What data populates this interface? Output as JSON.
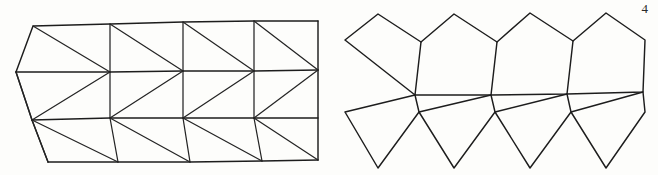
{
  "page": {
    "page_number": "4",
    "background_color": "#fdfdfb",
    "ink_color": "#1d1d1d",
    "width": 658,
    "height": 175
  },
  "figures": [
    {
      "id": "left-net",
      "name": "triangulated-strip-net",
      "kind": "triangle-strip",
      "band_count": 3,
      "column_count": 4,
      "bounds": {
        "x": 16,
        "y": 24,
        "width": 302,
        "height": 140
      },
      "top_edge_y": 26,
      "upper_mid_y": 72,
      "lower_mid_y": 120,
      "bottom_edge_y": 162
    },
    {
      "id": "right-net",
      "name": "rhombus-kite-net",
      "kind": "rhombus-zigzag",
      "row_count": 2,
      "column_count": 4,
      "bounds": {
        "x": 345,
        "y": 10,
        "width": 300,
        "height": 160
      },
      "upper_peak_y": 14,
      "waist_upper_y": 40,
      "middle_y": 95,
      "waist_lower_y": 112,
      "lower_peak_y": 168
    }
  ],
  "geometry": {
    "left_net_paths": [
      "M16,72 L33,26 L318,22",
      "M16,72 L32,120",
      "M32,120 L48,162",
      "M16,72 L318,70",
      "M32,120 L318,118",
      "M48,162 L318,160",
      "M33,26 L110,72",
      "M110,72 L104,26",
      "M104,26 L183,71",
      "M183,71 L176,24",
      "M176,24 L254,71",
      "M254,71 L247,23",
      "M247,23 L318,70",
      "M16,72 L110,118",
      "M110,118 L110,72",
      "M110,72 L183,118",
      "M183,118 L183,71",
      "M183,71 L254,118",
      "M254,118 L254,71",
      "M254,71 L318,118",
      "M32,120 L118,162",
      "M118,162 L110,118",
      "M110,118 L190,162",
      "M190,162 L183,118",
      "M183,118 L262,162",
      "M262,162 L254,118",
      "M254,118 L318,160"
    ],
    "right_net_paths": [
      "M345,40 L378,14 L421,42",
      "M421,42 L415,95",
      "M345,40 L415,95",
      "M421,42 L454,14 L497,42",
      "M497,42 L491,95",
      "M415,95 L491,95",
      "M497,42 L530,13 L573,41",
      "M573,41 L567,94",
      "M491,95 L567,94",
      "M573,41 L606,13 L645,40",
      "M645,40 L643,92",
      "M567,94 L643,92",
      "M345,112 L378,168 L419,112",
      "M345,112 L415,95",
      "M415,95 L419,112",
      "M419,112 L454,168 L495,112",
      "M491,95 L419,112",
      "M491,95 L495,112",
      "M495,112 L530,168 L571,112",
      "M567,94 L495,112",
      "M567,94 L571,112",
      "M571,112 L606,168 L645,112",
      "M643,92 L571,112",
      "M643,92 L645,112"
    ]
  }
}
